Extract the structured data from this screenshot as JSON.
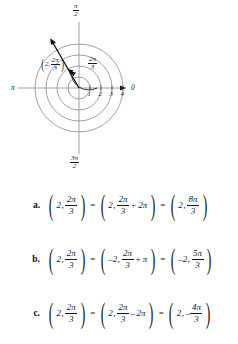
{
  "figure": {
    "name": "polar-coordinate-grid",
    "axis_labels": {
      "right": "0",
      "left": "π",
      "top_num": "π",
      "top_den": "2",
      "bottom_num": "3π",
      "bottom_den": "2"
    },
    "radial_ticks": [
      "1",
      "2",
      "3",
      "4"
    ],
    "circle_radii": [
      1,
      2,
      3,
      4
    ],
    "plotted_point": {
      "r": "2",
      "theta_num": "2π",
      "theta_den": "3",
      "theta_degrees": 120
    },
    "angle_arc_label": {
      "num": "2π",
      "den": "3"
    }
  },
  "choices": [
    {
      "letter": "a.",
      "lhs": {
        "r": "2",
        "num": "2π",
        "den": "3"
      },
      "middle": {
        "r": "2",
        "num": "2π",
        "den": "3",
        "op": "+",
        "term": "2π"
      },
      "rhs": {
        "r": "2",
        "num": "8π",
        "den": "3"
      }
    },
    {
      "letter": "b.",
      "lhs": {
        "r": "2",
        "num": "2π",
        "den": "3"
      },
      "middle": {
        "r": "–2",
        "num": "2π",
        "den": "3",
        "op": "+",
        "term": "π"
      },
      "rhs": {
        "r": "–2",
        "num": "5π",
        "den": "3"
      }
    },
    {
      "letter": "c.",
      "lhs": {
        "r": "2",
        "num": "2π",
        "den": "3"
      },
      "middle": {
        "r": "2",
        "num": "2π",
        "den": "3",
        "op": "–",
        "term": "2π"
      },
      "rhs": {
        "r": "2",
        "minus": "–",
        "num": "4π",
        "den": "3"
      }
    }
  ],
  "equals": "=",
  "comma": ",",
  "paren_open": "(",
  "paren_close": ")",
  "colors": {
    "ink": "#1a1a1a",
    "grid": "#8a8a8a",
    "background": "#ffffff"
  }
}
